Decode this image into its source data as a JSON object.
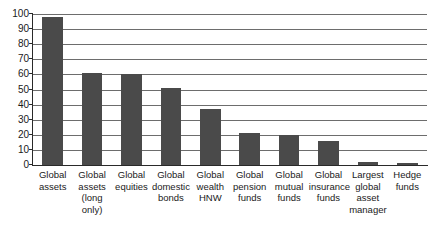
{
  "chart_data": {
    "type": "bar",
    "title": "",
    "subtitle": "",
    "xlabel": "",
    "ylabel": "",
    "ylim": [
      0,
      100
    ],
    "ytick_step": 10,
    "yticks": [
      "100",
      "90",
      "80",
      "70",
      "60",
      "50",
      "40",
      "30",
      "20",
      "10",
      "0"
    ],
    "grid": true,
    "legend": "none",
    "bar_color": "#4a4a4a",
    "axis_color": "#2a2a2a",
    "gridline_color": "#6d6d6d",
    "categories": [
      "Global assets",
      "Global assets (long only)",
      "Global equities",
      "Global domestic bonds",
      "Global wealth HNW",
      "Global pension funds",
      "Global mutual funds",
      "Global insurance funds",
      "Largest global asset manager",
      "Hedge funds"
    ],
    "category_lines": [
      [
        "Global",
        "assets"
      ],
      [
        "Global",
        "assets",
        "(long",
        "only)"
      ],
      [
        "Global",
        "equities"
      ],
      [
        "Global",
        "domestic",
        "bonds"
      ],
      [
        "Global",
        "wealth",
        "HNW"
      ],
      [
        "Global",
        "pension",
        "funds"
      ],
      [
        "Global",
        "mutual",
        "funds"
      ],
      [
        "Global",
        "insurance",
        "funds"
      ],
      [
        "Largest",
        "global",
        "asset",
        "manager"
      ],
      [
        "Hedge",
        "funds"
      ]
    ],
    "values": [
      98,
      61,
      60,
      51,
      37,
      21,
      20,
      16,
      2,
      1.5
    ]
  }
}
